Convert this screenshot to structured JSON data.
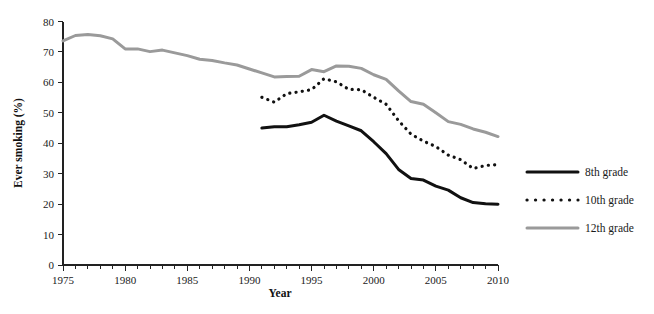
{
  "chart_data": {
    "type": "line",
    "title": "",
    "subtitle": "",
    "xlabel": "Year",
    "ylabel": "Ever smoking (%)",
    "xlim": [
      1975,
      2010
    ],
    "ylim": [
      0,
      80
    ],
    "grid": false,
    "legend_position": "right",
    "x_ticks_major": [
      1975,
      1980,
      1985,
      1990,
      1995,
      2000,
      2005,
      2010
    ],
    "x_tick_labels": [
      "1975",
      "1980",
      "1985",
      "1990",
      "1995",
      "2000",
      "2005",
      "2010"
    ],
    "x_tick_minor_step": 1,
    "y_ticks": [
      0,
      10,
      20,
      30,
      40,
      50,
      60,
      70,
      80
    ],
    "y_tick_labels": [
      "0",
      "10",
      "20",
      "30",
      "40",
      "50",
      "60",
      "70",
      "80"
    ],
    "series": [
      {
        "name": "8th grade",
        "legend_label": "8th grade",
        "style": "solid",
        "color": "#111111",
        "width": 3.0,
        "x": [
          1991,
          1992,
          1993,
          1994,
          1995,
          1996,
          1997,
          1998,
          1999,
          2000,
          2001,
          2002,
          2003,
          2004,
          2005,
          2006,
          2007,
          2008,
          2009,
          2010
        ],
        "values": [
          45.0,
          45.4,
          45.4,
          46.1,
          46.9,
          49.2,
          47.3,
          45.7,
          44.1,
          40.5,
          36.6,
          31.4,
          28.4,
          27.9,
          25.9,
          24.6,
          22.1,
          20.5,
          20.1,
          20.0
        ]
      },
      {
        "name": "10th grade",
        "legend_label": "10th grade",
        "style": "dotted",
        "color": "#111111",
        "width": 3.2,
        "x": [
          1991,
          1992,
          1993,
          1994,
          1995,
          1996,
          1997,
          1998,
          1999,
          2000,
          2001,
          2002,
          2003,
          2004,
          2005,
          2006,
          2007,
          2008,
          2009,
          2010
        ],
        "values": [
          55.1,
          53.5,
          56.3,
          56.9,
          57.6,
          61.2,
          60.2,
          57.7,
          57.6,
          55.1,
          52.8,
          47.4,
          43.0,
          40.7,
          38.9,
          36.1,
          34.6,
          31.7,
          32.7,
          33.0
        ]
      },
      {
        "name": "12th grade",
        "legend_label": "12th grade",
        "style": "solid",
        "color": "#9a9a9a",
        "width": 3.0,
        "x": [
          1975,
          1976,
          1977,
          1978,
          1979,
          1980,
          1981,
          1982,
          1983,
          1984,
          1985,
          1986,
          1987,
          1988,
          1989,
          1990,
          1991,
          1992,
          1993,
          1994,
          1995,
          1996,
          1997,
          1998,
          1999,
          2000,
          2001,
          2002,
          2003,
          2004,
          2005,
          2006,
          2007,
          2008,
          2009,
          2010
        ],
        "values": [
          73.6,
          75.4,
          75.7,
          75.3,
          74.3,
          71.0,
          71.0,
          70.1,
          70.6,
          69.7,
          68.8,
          67.6,
          67.2,
          66.4,
          65.7,
          64.4,
          63.1,
          61.8,
          61.9,
          62.0,
          64.2,
          63.5,
          65.4,
          65.3,
          64.6,
          62.5,
          61.0,
          57.2,
          53.7,
          52.8,
          50.0,
          47.1,
          46.2,
          44.7,
          43.6,
          42.2
        ]
      }
    ]
  },
  "legend": {
    "items": [
      {
        "label": "8th grade"
      },
      {
        "label": "10th grade"
      },
      {
        "label": "12th grade"
      }
    ]
  },
  "axes": {
    "x_title": "Year",
    "y_title": "Ever smoking (%)"
  },
  "colors": {
    "series_8th": "#111111",
    "series_10th": "#111111",
    "series_12th": "#9a9a9a",
    "axis": "#222222",
    "background": "#ffffff"
  }
}
